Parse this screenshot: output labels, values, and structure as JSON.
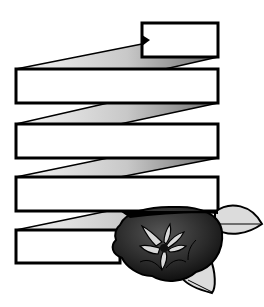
{
  "figure": {
    "title": "",
    "colors": {
      "stroke": "#000000",
      "panel_fill": "#ffffff",
      "fold_light": "#f2f2f2",
      "fold_dark": "#8a8a8a",
      "flower_dark": "#111111",
      "flower_mid": "#3a3a3a",
      "petal_light": "#d9d9d9",
      "leaf_fill": "#dcdcdc",
      "background": "#ffffff"
    },
    "panels": [
      {
        "id": "panel-top",
        "text": ""
      },
      {
        "id": "panel-1",
        "text": ""
      },
      {
        "id": "panel-2",
        "text": ""
      },
      {
        "id": "panel-3",
        "text": ""
      },
      {
        "id": "panel-4",
        "text": ""
      }
    ]
  }
}
